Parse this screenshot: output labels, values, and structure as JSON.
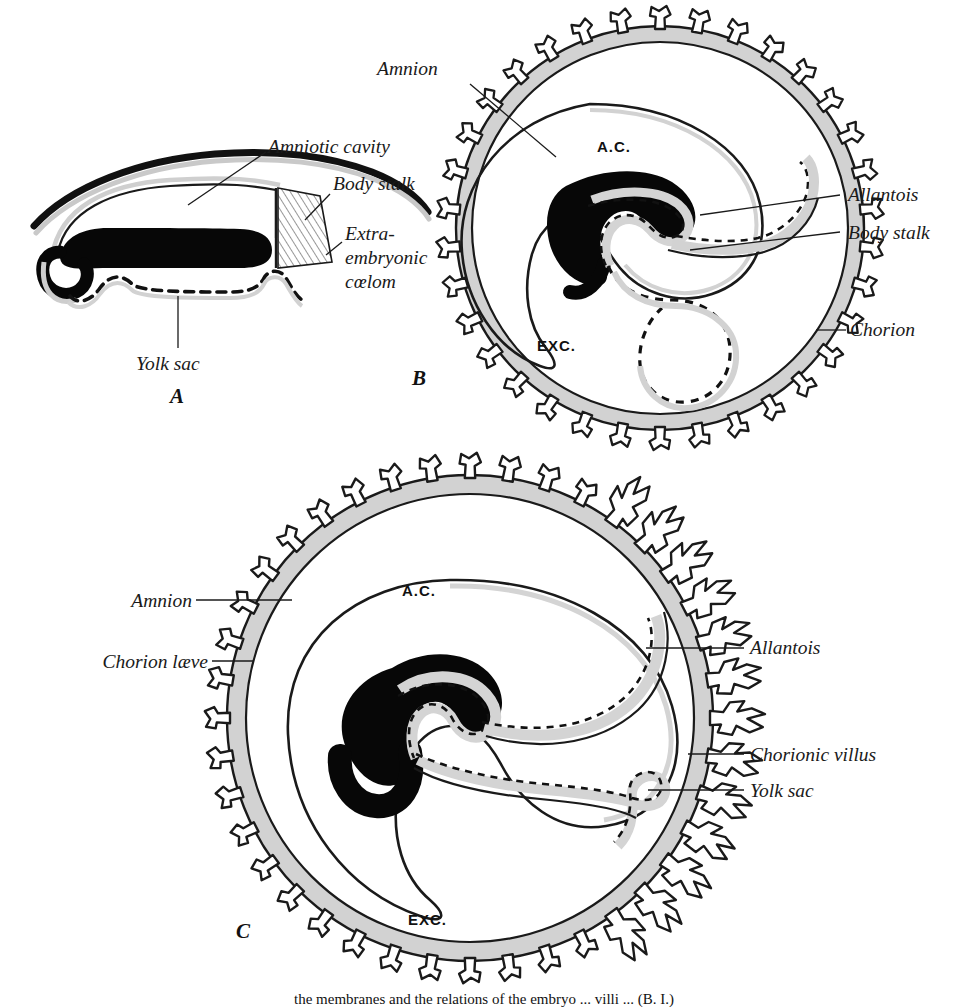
{
  "figure": {
    "panels": [
      {
        "id": "A",
        "letter": "A",
        "labels": [
          {
            "name": "amniotic-cavity",
            "text": "Amniotic cavity"
          },
          {
            "name": "body-stalk",
            "text": "Body stalk"
          },
          {
            "name": "extra-embryonic-coelom-line1",
            "text": "Extra-"
          },
          {
            "name": "extra-embryonic-coelom-line2",
            "text": "embryonic"
          },
          {
            "name": "extra-embryonic-coelom-line3",
            "text": "cœlom"
          },
          {
            "name": "yolk-sac",
            "text": "Yolk sac"
          }
        ]
      },
      {
        "id": "B",
        "letter": "B",
        "labels": [
          {
            "name": "amnion",
            "text": "Amnion"
          },
          {
            "name": "allantois",
            "text": "Allantois"
          },
          {
            "name": "body-stalk",
            "text": "Body stalk"
          },
          {
            "name": "chorion",
            "text": "Chorion"
          }
        ],
        "abbreviations": [
          {
            "name": "amniotic-cavity-abbr",
            "text": "A.C."
          },
          {
            "name": "extraembryonic-coelom-abbr",
            "text": "EXC."
          }
        ]
      },
      {
        "id": "C",
        "letter": "C",
        "labels": [
          {
            "name": "amnion",
            "text": "Amnion"
          },
          {
            "name": "chorion-laeve",
            "text": "Chorion læve"
          },
          {
            "name": "allantois",
            "text": "Allantois"
          },
          {
            "name": "chorionic-villus",
            "text": "Chorionic villus"
          },
          {
            "name": "yolk-sac",
            "text": "Yolk sac"
          }
        ],
        "abbreviations": [
          {
            "name": "amniotic-cavity-abbr",
            "text": "A.C."
          },
          {
            "name": "extraembryonic-coelom-abbr",
            "text": "EXC."
          }
        ]
      }
    ],
    "caption": "the membranes and the relations of the embryo ... villi ... (B. I.)",
    "colors": {
      "ink": "#1a1a1a",
      "mesoderm_gray": "#d2d2d2",
      "embryo_black": "#050505",
      "paper": "#ffffff"
    }
  }
}
